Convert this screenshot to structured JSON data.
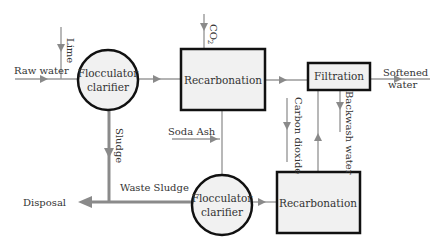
{
  "diagram": {
    "type": "process-flow",
    "nodes": [
      {
        "id": "flocc1",
        "shape": "circle",
        "label_line1": "Flocculator",
        "label_line2": "clarifier"
      },
      {
        "id": "recarb1",
        "shape": "box",
        "label": "Recarbonation"
      },
      {
        "id": "filtration",
        "shape": "box",
        "label": "Filtration"
      },
      {
        "id": "flocc2",
        "shape": "circle",
        "label_line1": "Flocculator",
        "label_line2": "clarifier"
      },
      {
        "id": "recarb2",
        "shape": "box",
        "label": "Recarbonation"
      }
    ],
    "labels": {
      "raw_water": "Raw water",
      "lime": "Lime",
      "co2": "CO",
      "co2_sub": "2",
      "softened_line1": "Softened",
      "softened_line2": "water",
      "sludge": "Sludge",
      "soda_ash": "Soda Ash",
      "carbon_dioxide": "Carbon dioxide",
      "backwash_water": "Backwash water",
      "waste_sludge": "Waste Sludge",
      "disposal": "Disposal"
    },
    "edges": [
      {
        "from": "Raw water",
        "to": "flocc1"
      },
      {
        "from": "Lime",
        "to": "flocc1"
      },
      {
        "from": "flocc1",
        "to": "recarb1"
      },
      {
        "from": "CO2",
        "to": "recarb1"
      },
      {
        "from": "recarb1",
        "to": "filtration"
      },
      {
        "from": "filtration",
        "to": "Softened water"
      },
      {
        "from": "flocc1",
        "to": "Disposal",
        "label": "Sludge"
      },
      {
        "from": "recarb1",
        "to": "flocc2"
      },
      {
        "from": "Soda Ash",
        "to": "flocc2"
      },
      {
        "from": "flocc2",
        "to": "Disposal",
        "label": "Waste Sludge"
      },
      {
        "from": "flocc2",
        "to": "recarb2"
      },
      {
        "from": "Carbon dioxide",
        "to": "recarb2"
      },
      {
        "from": "recarb2",
        "to": "filtration"
      },
      {
        "from": "filtration",
        "to": "recarb2",
        "label": "Backwash water"
      }
    ],
    "colors": {
      "node_fill": "#f1f1f1",
      "node_stroke": "#111111",
      "flow_line": "#9a9a9a",
      "text": "#333333"
    }
  }
}
